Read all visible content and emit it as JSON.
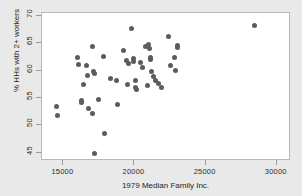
{
  "chart_data": {
    "type": "scatter",
    "title": "",
    "xlabel": "1979 Median Family Inc.",
    "ylabel": "% HHs with 2+ workers",
    "xlim": [
      13500,
      31000
    ],
    "ylim": [
      43.5,
      70.5
    ],
    "xticks": [
      15000,
      20000,
      25000,
      30000
    ],
    "yticks": [
      45,
      50,
      55,
      60,
      65,
      70
    ],
    "grid": false,
    "legend": "none",
    "marker": {
      "shape": "circle",
      "color": "#5c5c5c",
      "size_px": 5
    },
    "background": {
      "figure": "#e9e9e9",
      "plot": "#ffffff",
      "frame_border": "#b9b9b9"
    },
    "points": [
      {
        "x": 14520,
        "y": 53.5
      },
      {
        "x": 14560,
        "y": 51.8
      },
      {
        "x": 16000,
        "y": 62.4
      },
      {
        "x": 16080,
        "y": 61.1
      },
      {
        "x": 16250,
        "y": 54.5
      },
      {
        "x": 16300,
        "y": 54.2
      },
      {
        "x": 16400,
        "y": 57.4
      },
      {
        "x": 16620,
        "y": 61.0
      },
      {
        "x": 16700,
        "y": 59.1
      },
      {
        "x": 16760,
        "y": 53.1
      },
      {
        "x": 17050,
        "y": 64.4
      },
      {
        "x": 17080,
        "y": 52.2
      },
      {
        "x": 17150,
        "y": 59.8
      },
      {
        "x": 17200,
        "y": 59.5
      },
      {
        "x": 17220,
        "y": 44.9
      },
      {
        "x": 17450,
        "y": 54.8
      },
      {
        "x": 17800,
        "y": 62.5
      },
      {
        "x": 17900,
        "y": 48.6
      },
      {
        "x": 18300,
        "y": 58.6
      },
      {
        "x": 18750,
        "y": 58.1
      },
      {
        "x": 18800,
        "y": 53.8
      },
      {
        "x": 19250,
        "y": 63.6
      },
      {
        "x": 19450,
        "y": 61.8
      },
      {
        "x": 19500,
        "y": 57.5
      },
      {
        "x": 19600,
        "y": 61.2
      },
      {
        "x": 19800,
        "y": 67.6
      },
      {
        "x": 19900,
        "y": 62.2
      },
      {
        "x": 19950,
        "y": 61.6
      },
      {
        "x": 20050,
        "y": 58.1
      },
      {
        "x": 20100,
        "y": 56.9
      },
      {
        "x": 20150,
        "y": 56.6
      },
      {
        "x": 20400,
        "y": 61.4
      },
      {
        "x": 20550,
        "y": 60.5
      },
      {
        "x": 20750,
        "y": 64.3
      },
      {
        "x": 20900,
        "y": 57.2
      },
      {
        "x": 21000,
        "y": 64.7
      },
      {
        "x": 21050,
        "y": 64.1
      },
      {
        "x": 21100,
        "y": 62.4
      },
      {
        "x": 21150,
        "y": 62.0
      },
      {
        "x": 21200,
        "y": 59.9
      },
      {
        "x": 21350,
        "y": 58.9
      },
      {
        "x": 21500,
        "y": 58.2
      },
      {
        "x": 21700,
        "y": 57.6
      },
      {
        "x": 21900,
        "y": 57.0
      },
      {
        "x": 22400,
        "y": 66.3
      },
      {
        "x": 22500,
        "y": 61.0
      },
      {
        "x": 22800,
        "y": 62.4
      },
      {
        "x": 22850,
        "y": 60.1
      },
      {
        "x": 23000,
        "y": 64.6
      },
      {
        "x": 23050,
        "y": 64.2
      },
      {
        "x": 28400,
        "y": 68.3
      }
    ]
  }
}
